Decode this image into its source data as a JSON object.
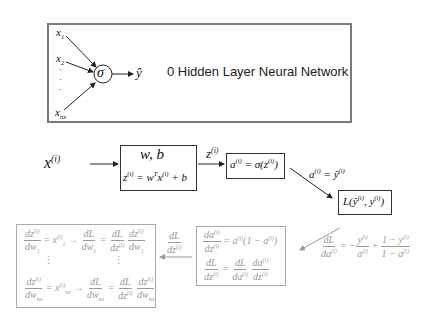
{
  "top": {
    "inputs": [
      "x",
      "x",
      "x"
    ],
    "input_subs": [
      "1",
      "2",
      "nx"
    ],
    "dots": "·",
    "neuron": "σ",
    "output": "ŷ",
    "title": "0 Hidden Layer Neural Network"
  },
  "forward": {
    "x_label": "x",
    "x_sup": "(i)",
    "params_title": "w, b",
    "z_eq": "z",
    "z_eq_rest": " = w",
    "z_eq_T": "T",
    "z_eq_x": "x",
    "z_eq_end": " + b",
    "z_label": "z",
    "a_box": "a",
    "a_box_rest": " = σ(z",
    "a_box_end": ")",
    "a_yhat": "a",
    "a_yhat_rest": " = ŷ",
    "loss": "L(ŷ",
    "loss_mid": ", y",
    "loss_end": ")",
    "sup": "(i)"
  },
  "backward": {
    "dLda_num": "dL",
    "dLda_den": "da",
    "dLda_rhs1_num": "y",
    "dLda_rhs1_den": "a",
    "dLda_rhs2_num": "1 − y",
    "dLda_rhs2_den": "1 − a",
    "dadz_num": "da",
    "dadz_den": "dz",
    "dadz_rhs": " = a",
    "dadz_rhs2": "(1 − a",
    "dadz_rhs3": ")",
    "dLdz_num": "dL",
    "dLdz_den": "dz",
    "arrow_label_num": "dL",
    "arrow_label_den": "dz",
    "dzdw_num": "dz",
    "dzdw1_den": "dw",
    "dzdw1_sub": "1",
    "x1": "x",
    "x1_sub": "1",
    "dLdw_num": "dL",
    "dLdw_den": "dw",
    "dwn_sub": "nx",
    "vdots": "⋮",
    "sup": "(i)"
  }
}
